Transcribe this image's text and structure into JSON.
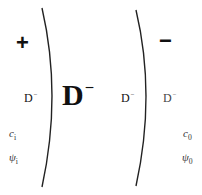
{
  "diagram": {
    "left_region": {
      "sign": "+",
      "field": {
        "base": "D",
        "sup": "−"
      },
      "variables": [
        {
          "symbol": "c",
          "subscript": "i"
        },
        {
          "symbol": "ψ",
          "subscript": "i"
        }
      ]
    },
    "center_region": {
      "field_large": {
        "base": "D",
        "sup": "−"
      },
      "field_small": {
        "base": "D",
        "sup": "−"
      }
    },
    "right_region": {
      "sign": "−",
      "field": {
        "base": "D",
        "sup": "−"
      },
      "variables": [
        {
          "symbol": "c",
          "subscript": "0"
        },
        {
          "symbol": "ψ",
          "subscript": "0"
        }
      ]
    },
    "colors": {
      "ink": "#111111",
      "line": "#222222"
    }
  }
}
